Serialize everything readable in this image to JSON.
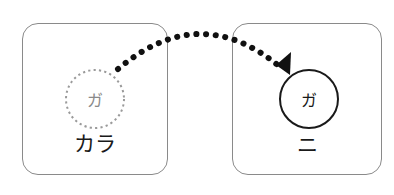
{
  "diagram": {
    "source": {
      "label": "カラ",
      "item": "ガ",
      "style": "dashed-circle"
    },
    "target": {
      "label": "ニ",
      "item": "ガ",
      "style": "solid-circle"
    },
    "arrow": {
      "style": "dotted",
      "direction": "source-to-target"
    }
  },
  "colors": {
    "box_border": "#8a8a8a",
    "dashed_circle": "#9a9a9a",
    "solid_circle": "#1a1a1a",
    "arrow": "#111111"
  }
}
